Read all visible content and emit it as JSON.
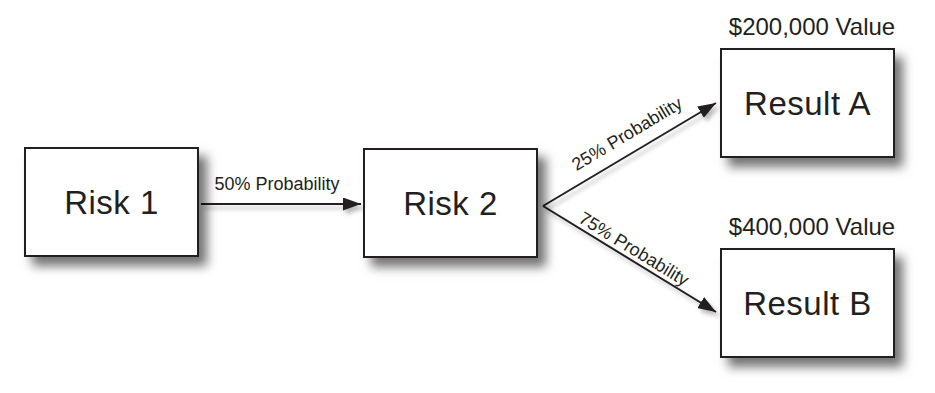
{
  "diagram": {
    "nodes": {
      "risk1": {
        "label": "Risk 1"
      },
      "risk2": {
        "label": "Risk 2"
      },
      "result_a": {
        "label": "Result A",
        "value": "$200,000 Value"
      },
      "result_b": {
        "label": "Result B",
        "value": "$400,000 Value"
      }
    },
    "edges": {
      "risk1_to_risk2": {
        "label": "50% Probability"
      },
      "risk2_to_result_a": {
        "label": "25% Probability"
      },
      "risk2_to_result_b": {
        "label": "75% Probability"
      }
    },
    "colors": {
      "background": "#ffffff",
      "box_fill": "#ffffff",
      "box_border": "#231f20",
      "text": "#231f20",
      "connector": "#231f20"
    }
  }
}
